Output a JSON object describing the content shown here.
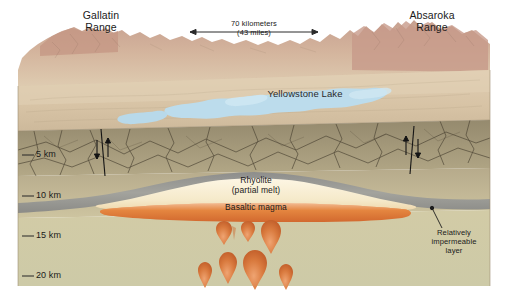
{
  "figure": {
    "width": 508,
    "height": 304
  },
  "surface_labels": {
    "left_range": "Gallatin\nRange",
    "right_range": "Absaroka\nRange",
    "lake": "Yellowstone Lake"
  },
  "scale_bar": {
    "primary": "70 kilometers",
    "secondary": "(43 miles)"
  },
  "depth_axis": {
    "ticks": [
      {
        "label": "5 km",
        "depth_km": 5
      },
      {
        "label": "10 km",
        "depth_km": 10
      },
      {
        "label": "15 km",
        "depth_km": 15
      },
      {
        "label": "20 km",
        "depth_km": 20
      }
    ]
  },
  "subsurface_labels": {
    "rhyolite": "Rhyolite\n(partial melt)",
    "basalt": "Basaltic magma",
    "impermeable": "Relatively\nimpermeable\nlayer"
  },
  "colors": {
    "sky": "#ffffff",
    "mountain_pink": "#c9a291",
    "mountain_tan": "#d8c3a6",
    "plateau": "#ddcbb0",
    "lake_blue": "#bcdcec",
    "fractured_rock": "#8c8268",
    "upper_crust": "#b5a98a",
    "mid_crust": "#cfc6a2",
    "lower_crust": "#cdc9a4",
    "impermeable_gray": "#9a9a96",
    "rhyolite_cream": "#f6ecd2",
    "basalt_orange": "#e5873f",
    "plume_orange": "#d4703a",
    "ink": "#1a1a1a"
  },
  "features": {
    "faults": [
      {
        "name": "left-caldera-fault",
        "x": 101
      },
      {
        "name": "right-caldera-fault",
        "x": 414
      }
    ],
    "plume_count": 8
  }
}
